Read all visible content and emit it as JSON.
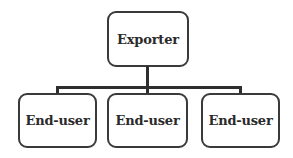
{
  "diagram": {
    "type": "hierarchy",
    "root": {
      "label": "Exporter"
    },
    "children": [
      {
        "label": "End-user"
      },
      {
        "label": "End-user"
      },
      {
        "label": "End-user"
      }
    ],
    "colors": {
      "border": "#3a3a3a",
      "connector": "#2e2e2e",
      "text": "#2a2a2a",
      "background": "#ffffff"
    }
  }
}
